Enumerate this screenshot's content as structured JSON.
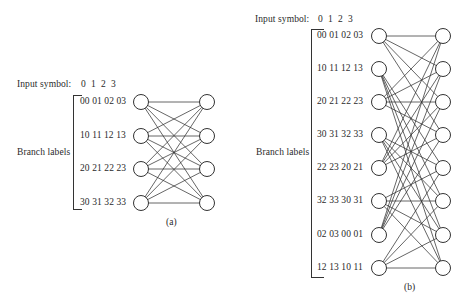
{
  "diagram_a": {
    "caption": "(a)",
    "input_symbol_label": "Input symbol:",
    "input_symbols": [
      "0",
      "1",
      "2",
      "3"
    ],
    "branch_labels_title": "Branch labels",
    "states": [
      {
        "labels": "00 01 02 03"
      },
      {
        "labels": "10 11 12 13"
      },
      {
        "labels": "20 21 22 23"
      },
      {
        "labels": "30 31 32 33"
      }
    ],
    "transitions": [
      [
        0,
        0
      ],
      [
        0,
        1
      ],
      [
        0,
        2
      ],
      [
        0,
        3
      ],
      [
        1,
        0
      ],
      [
        1,
        1
      ],
      [
        1,
        2
      ],
      [
        1,
        3
      ],
      [
        2,
        0
      ],
      [
        2,
        1
      ],
      [
        2,
        2
      ],
      [
        2,
        3
      ],
      [
        3,
        0
      ],
      [
        3,
        1
      ],
      [
        3,
        2
      ],
      [
        3,
        3
      ]
    ]
  },
  "diagram_b": {
    "caption": "(b)",
    "input_symbol_label": "Input symbol:",
    "input_symbols": [
      "0",
      "1",
      "2",
      "3"
    ],
    "branch_labels_title": "Branch labels",
    "states": [
      {
        "labels": "00 01 02 03"
      },
      {
        "labels": "10 11 12 13"
      },
      {
        "labels": "20 21 22 23"
      },
      {
        "labels": "30 31 32 33"
      },
      {
        "labels": "22 23 20 21"
      },
      {
        "labels": "32 33 30 31"
      },
      {
        "labels": "02 03 00 01"
      },
      {
        "labels": "12 13 10 11"
      }
    ],
    "transitions": [
      [
        0,
        0
      ],
      [
        0,
        1
      ],
      [
        0,
        2
      ],
      [
        0,
        3
      ],
      [
        1,
        4
      ],
      [
        1,
        5
      ],
      [
        1,
        6
      ],
      [
        1,
        7
      ],
      [
        2,
        0
      ],
      [
        2,
        1
      ],
      [
        2,
        2
      ],
      [
        2,
        3
      ],
      [
        3,
        4
      ],
      [
        3,
        5
      ],
      [
        3,
        6
      ],
      [
        3,
        7
      ],
      [
        4,
        0
      ],
      [
        4,
        1
      ],
      [
        4,
        2
      ],
      [
        4,
        3
      ],
      [
        5,
        4
      ],
      [
        5,
        5
      ],
      [
        5,
        6
      ],
      [
        5,
        7
      ],
      [
        6,
        0
      ],
      [
        6,
        1
      ],
      [
        6,
        2
      ],
      [
        6,
        3
      ],
      [
        7,
        4
      ],
      [
        7,
        5
      ],
      [
        7,
        6
      ],
      [
        7,
        7
      ]
    ]
  }
}
